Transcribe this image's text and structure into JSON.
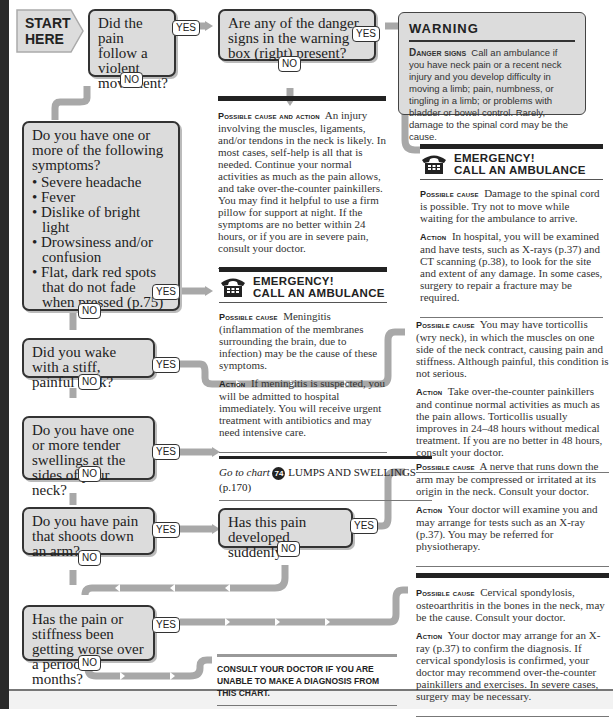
{
  "start": {
    "label_line1": "START",
    "label_line2": "HERE"
  },
  "labels": {
    "yes": "YES",
    "no": "NO"
  },
  "questions": [
    {
      "id": "q1",
      "text": "Did the pain follow a violent movement?"
    },
    {
      "id": "q2",
      "text": "Are any of the danger signs in the warning box (right) present?"
    },
    {
      "id": "q3",
      "text": "Do you have one or more of the following symptoms?",
      "bullets": [
        "Severe headache",
        "Fever",
        "Dislike of bright light",
        "Drowsiness and/or confusion",
        "Flat, dark red spots that do not fade when pressed (p.75)"
      ]
    },
    {
      "id": "q4",
      "text": "Did you wake with a stiff, painful neck?"
    },
    {
      "id": "q5",
      "text": "Do you have one or more tender swellings at the sides of your neck?"
    },
    {
      "id": "q6",
      "text": "Do you have pain that shoots down an arm?"
    },
    {
      "id": "q7",
      "text": "Has this pain developed suddenly?"
    },
    {
      "id": "q8",
      "text": "Has the pain or stiffness been getting worse over a period of months?"
    }
  ],
  "warning": {
    "title": "WARNING",
    "lead": "Danger signs",
    "body": "Call an ambulance if you have neck pain or a recent neck injury and you develop difficulty in moving a limb; pain, numbness, or tingling in a limb; or problems with bladder or bowel control. Rarely, damage to the spinal cord may be the cause."
  },
  "emergency": {
    "line1": "EMERGENCY!",
    "line2": "CALL AN AMBULANCE"
  },
  "results": {
    "muscle": {
      "lead": "Possible cause and action",
      "text": "An injury involving the muscles, ligaments, and/or tendons in the neck is likely. In most cases, self-help is all that is needed. Continue your normal activities as much as the pain allows, and take over-the-counter painkillers. You may find it helpful to use a firm pillow for support at night. If the symptoms are no better within 24 hours, or if you are in severe pain, consult your doctor."
    },
    "spinal": {
      "cause_lead": "Possible cause",
      "cause": "Damage to the spinal cord is possible. Try not to move while waiting for the ambulance to arrive.",
      "action_lead": "Action",
      "action": "In hospital, you will be examined and have tests, such as X-rays (p.37) and CT scanning (p.38), to look for the site and extent of any damage. In some cases, surgery to repair a fracture may be required."
    },
    "meningitis": {
      "cause_lead": "Possible cause",
      "cause": "Meningitis (inflammation of the membranes surrounding the brain, due to infection) may be the cause of these symptoms.",
      "action_lead": "Action",
      "action": "If meningitis is suspected, you will be admitted to hospital immediately. You will receive urgent treatment with antibiotics and may need intensive care."
    },
    "torticollis": {
      "cause_lead": "Possible cause",
      "cause": "You may have torticollis (wry neck), in which the muscles on one side of the neck contract, causing pain and stiffness. Although painful, this condition is not serious.",
      "action_lead": "Action",
      "action": "Take over-the-counter painkillers and continue normal activities as much as the pain allows. Torticollis usually improves in 24–48 hours without medical treatment. If you are no better in 48 hours, consult your doctor."
    },
    "nerve": {
      "cause_lead": "Possible cause",
      "cause": "A nerve that runs down the arm may be compressed or irritated at its origin in the neck. Consult your doctor.",
      "action_lead": "Action",
      "action": "Your doctor will examine you and may arrange for tests such as an X-ray (p.37). You may be referred for physiotherapy."
    },
    "spondylosis": {
      "cause_lead": "Possible cause",
      "cause": "Cervical spondylosis, osteoarthritis in the bones in the neck, may be the cause. Consult your doctor.",
      "action_lead": "Action",
      "action": "Your doctor may arrange for an X-ray (p.37) to confirm the diagnosis. If cervical spondylosis is confirmed, your doctor may recommend over-the-counter painkillers and exercises. In severe cases, surgery may be necessary."
    }
  },
  "goto": {
    "prefix": "Go to chart",
    "chart_number": "74",
    "chart_name": "LUMPS AND SWELLINGS",
    "page": "(p.170)"
  },
  "consult": "CONSULT YOUR DOCTOR IF YOU ARE UNABLE TO MAKE A DIAGNOSIS FROM THIS CHART.",
  "colors": {
    "box_fill": "#dcdcdc",
    "connector": "#a8a8a8",
    "border": "#333333"
  }
}
